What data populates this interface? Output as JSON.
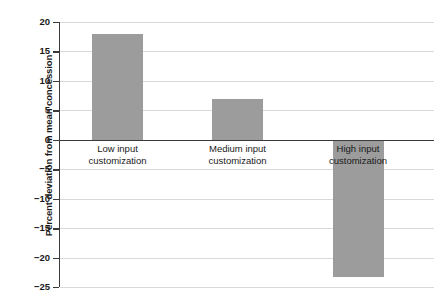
{
  "chart_data": {
    "type": "bar",
    "title": "",
    "subtitle": "",
    "xlabel": "",
    "ylabel": "Percent deviation from mean concession",
    "categories": [
      "Low input customization",
      "Medium input customization",
      "High input customization"
    ],
    "category_lines": [
      [
        "Low input",
        "customization"
      ],
      [
        "Medium input",
        "customization"
      ],
      [
        "High input",
        "customization"
      ]
    ],
    "values": [
      18.0,
      6.9,
      -23.3
    ],
    "ylim": [
      -25,
      20
    ],
    "ytick_values": [
      20,
      15,
      10,
      5,
      0,
      -5,
      -10,
      -15,
      -20,
      -25
    ],
    "ytick_labels": [
      "20",
      "15",
      "10",
      "5",
      "0",
      "−5",
      "−10",
      "−15",
      "−20",
      "−25"
    ],
    "grid": true,
    "grid_axis": "y",
    "legend": "none",
    "bar_color": "#9c9c9c",
    "gridline_color": "#d9d9d9",
    "axis_color": "#3a3a3a",
    "background_color": "#ffffff"
  }
}
